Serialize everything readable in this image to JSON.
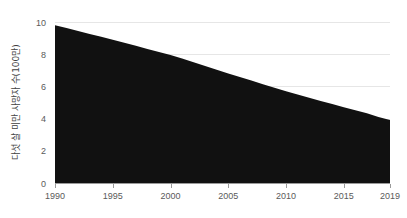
{
  "chart_data": {
    "type": "area",
    "title": "",
    "subtitle": "",
    "xlabel": "",
    "ylabel": "다섯 살 미만 사망자 수(100만)",
    "xlim": [
      1990,
      2019
    ],
    "ylim": [
      0,
      10
    ],
    "grid": true,
    "legend": "none",
    "fill_color": "#111111",
    "gridline_color": "#e6e6e6",
    "axis_color": "#9a9a9a",
    "background_color": "#ffffff",
    "x_tick_labels": [
      "1990",
      "1995",
      "2000",
      "2005",
      "2010",
      "2015",
      "2019"
    ],
    "x_tick_values": [
      1990,
      1995,
      2000,
      2005,
      2010,
      2015,
      2019
    ],
    "y_tick_labels": [
      "0",
      "2",
      "4",
      "6",
      "8",
      "10"
    ],
    "y_tick_values": [
      0,
      2,
      4,
      6,
      8,
      10
    ],
    "series": [
      {
        "name": "다섯 살 미만 사망자 수",
        "x": [
          1990,
          1991,
          1992,
          1993,
          1994,
          1995,
          1996,
          1997,
          1998,
          1999,
          2000,
          2001,
          2002,
          2003,
          2004,
          2005,
          2006,
          2007,
          2008,
          2009,
          2010,
          2011,
          2012,
          2013,
          2014,
          2015,
          2016,
          2017,
          2018,
          2019
        ],
        "values": [
          9.8,
          9.62,
          9.44,
          9.26,
          9.08,
          8.9,
          8.71,
          8.52,
          8.33,
          8.14,
          7.95,
          7.73,
          7.5,
          7.27,
          7.04,
          6.8,
          6.58,
          6.36,
          6.14,
          5.92,
          5.7,
          5.5,
          5.3,
          5.1,
          4.9,
          4.7,
          4.52,
          4.34,
          4.1,
          3.92
        ]
      }
    ]
  }
}
